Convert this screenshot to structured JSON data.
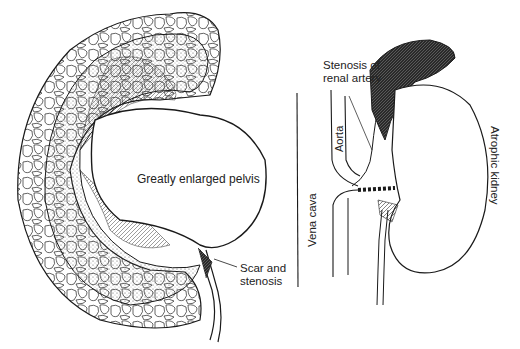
{
  "figure": {
    "left_panel": {
      "name": "hydronephrotic-kidney",
      "labels": {
        "pelvis": "Greatly enlarged pelvis",
        "scar_line1": "Scar and",
        "scar_line2": "stenosis"
      }
    },
    "right_panel": {
      "name": "renal-artery-stenosis",
      "labels": {
        "stenosis_line1": "Stenosis of",
        "stenosis_line2": "renal artery",
        "aorta": "Aorta",
        "vena_cava": "Vena cava",
        "atrophic": "Atrophic kidney"
      }
    },
    "colors": {
      "ink": "#1a1a1a",
      "background": "#ffffff",
      "hatch": "#555555"
    }
  }
}
